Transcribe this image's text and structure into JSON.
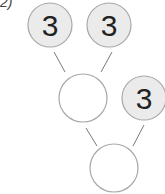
{
  "problem_label": "2)",
  "colors": {
    "filled_circle": "#ebebeb",
    "empty_circle": "#ffffff",
    "stroke": "#a8a8a8",
    "line": "#7a7a7a",
    "digit": "#222222"
  },
  "tree": {
    "top_left": {
      "value": "3",
      "filled": true
    },
    "top_right": {
      "value": "3",
      "filled": true
    },
    "middle_sum": {
      "value": "",
      "filled": false
    },
    "middle_right": {
      "value": "3",
      "filled": true
    },
    "bottom_sum": {
      "value": "",
      "filled": false
    }
  }
}
